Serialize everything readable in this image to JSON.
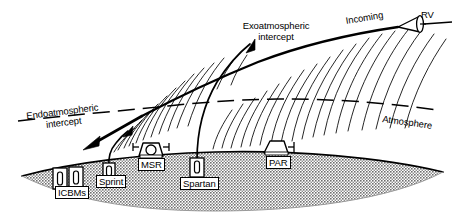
{
  "figure": {
    "type": "technical-schematic",
    "width": 454,
    "height": 220,
    "background_color": "#ffffff",
    "ink_color": "#000000",
    "ground_fill_color": "#a8a8a8"
  },
  "labels": {
    "rv": "RV",
    "incoming": "Incoming",
    "exoatmospheric_line1": "Exoatmospheric",
    "exoatmospheric_line2": "intercept",
    "endoatmospheric_line1": "Endoatmospheric",
    "endoatmospheric_line2": "intercept",
    "atmosphere": "Atmosphere",
    "icbms": "ICBMs",
    "sprint": "Sprint",
    "msr": "MSR",
    "spartan": "Spartan",
    "par": "PAR"
  },
  "elements": {
    "rv_cone": "reentry-vehicle-cone",
    "incoming_track": "incoming-trajectory-line",
    "atmosphere_boundary": "atmosphere-dashed-line",
    "atmosphere_hatching": "atmosphere-curved-hatch-lines",
    "exo_interceptor_track": "spartan-interceptor-trajectory",
    "endo_interceptor_track": "sprint-interceptor-trajectory",
    "ground_mass": "ground-cross-section",
    "icbm_silos": "icbm-silo-pair",
    "sprint_silo": "sprint-launch-silo",
    "spartan_silo": "spartan-launch-silo",
    "msr_radar": "msr-dome-radar",
    "par_radar": "par-phased-array-radar"
  },
  "geometry": {
    "ground_surface_apex_x": 215,
    "ground_surface_apex_y": 152,
    "atmosphere_dash_left_y": 117,
    "atmosphere_dash_right_y": 113,
    "rv_x": 415,
    "rv_y": 23,
    "exo_intercept_x": 248,
    "exo_intercept_y": 60,
    "endo_intercept_x": 88,
    "endo_intercept_y": 140
  }
}
